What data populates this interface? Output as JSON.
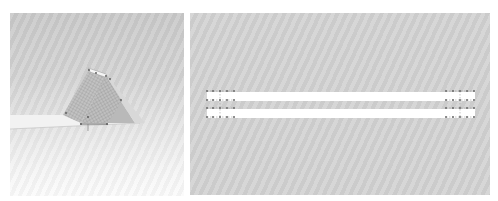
{
  "figures": [
    {
      "id": "left",
      "description": "Perspective render of an A-frame / triangular prism structure with meshed faces resting on a flat strip",
      "background_colors": [
        "#c9c9c9",
        "#fbfbfb"
      ],
      "mesh_color": "#8a8a8a",
      "node_color": "#555555"
    },
    {
      "id": "right",
      "description": "Plan view of two parallel white bars with node markers at both ends",
      "background_color": "#d2d2d2",
      "bar_color": "#ffffff",
      "node_color": "#6a6a6a",
      "bars": [
        {
          "x": 17,
          "y": 79,
          "w": 268,
          "h": 9
        },
        {
          "x": 17,
          "y": 96,
          "w": 268,
          "h": 9
        }
      ],
      "node_rows_y": [
        78,
        87,
        95,
        104
      ],
      "left_node_cols_x": [
        17,
        23,
        30,
        37,
        44
      ],
      "right_node_cols_x": [
        256,
        263,
        270,
        277,
        284
      ]
    }
  ]
}
